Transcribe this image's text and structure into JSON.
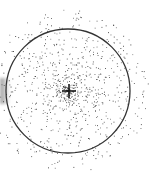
{
  "figure": {
    "circle": {
      "cx": 68,
      "cy": 91,
      "r": 62,
      "stroke": "#333333",
      "stroke_width": 1.3
    },
    "crosshair": {
      "cx": 69,
      "cy": 91,
      "size": 7,
      "color": "#1a1a1a"
    },
    "dots": {
      "count": 900,
      "color": "#222222",
      "spread_x": 50,
      "spread_y": 50,
      "max_radius": 82,
      "seed": 7
    },
    "left_smudge_color": "#9a9a9a"
  }
}
